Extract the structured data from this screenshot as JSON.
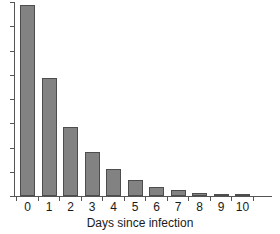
{
  "chart_data": {
    "type": "bar",
    "title": "",
    "xlabel": "Days since infection",
    "ylabel": "",
    "categories": [
      "0",
      "1",
      "2",
      "3",
      "4",
      "5",
      "6",
      "7",
      "8",
      "9",
      "10"
    ],
    "values": [
      100,
      61.5,
      35.9,
      22.9,
      14.1,
      8.3,
      4.7,
      3.1,
      1.6,
      1.0,
      0.5
    ],
    "xlim": [
      0,
      11
    ],
    "ylim": [
      0,
      101.5
    ],
    "grid": false,
    "legend": null,
    "bar_color": "#828282",
    "bar_edge_color": "#4d4d4d",
    "axis_color": "#555555",
    "text_color": "#1a1a1a",
    "y_axis_labeled": false,
    "y_tick_count": 9,
    "annotations": []
  },
  "figure": {
    "background": "#ffffff"
  }
}
